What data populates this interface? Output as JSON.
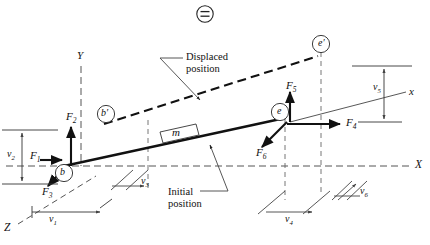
{
  "figure": {
    "type": "engineering-mechanics-free-body-diagram",
    "top_icon": "circled-equals-icon"
  },
  "axes": [
    {
      "name": "Y",
      "label": "Y",
      "style": "dashed",
      "direction": "up",
      "x": 81,
      "y": 57
    },
    {
      "name": "X",
      "label": "X",
      "style": "dashed",
      "direction": "right",
      "x": 418,
      "y": 166
    },
    {
      "name": "Z",
      "label": "Z",
      "style": "dashed",
      "direction": "lower-left",
      "x": 6,
      "y": 229
    },
    {
      "name": "x",
      "label": "x",
      "style": "solid",
      "direction": "up-right-incline",
      "x": 411,
      "y": 93
    }
  ],
  "points": [
    {
      "label": "b",
      "circled": true,
      "x": 64,
      "y": 173
    },
    {
      "label": "b′",
      "circled": true,
      "x": 106,
      "y": 114
    },
    {
      "label": "e",
      "circled": true,
      "x": 280,
      "y": 112
    },
    {
      "label": "e′",
      "circled": true,
      "x": 321,
      "y": 44
    }
  ],
  "forces": [
    {
      "label": "F",
      "sub": "1",
      "x": 34,
      "y": 157,
      "direction": "right"
    },
    {
      "label": "F",
      "sub": "2",
      "x": 72,
      "y": 118,
      "direction": "up"
    },
    {
      "label": "F",
      "sub": "3",
      "x": 48,
      "y": 192,
      "direction": "down-left"
    },
    {
      "label": "F",
      "sub": "4",
      "x": 351,
      "y": 122,
      "direction": "right"
    },
    {
      "label": "F",
      "sub": "5",
      "x": 294,
      "y": 88,
      "direction": "up"
    },
    {
      "label": "F",
      "sub": "6",
      "x": 261,
      "y": 153,
      "direction": "down-left"
    }
  ],
  "dimensions": [
    {
      "label": "v",
      "sub": "1",
      "x": 52,
      "y": 221,
      "orientation": "horizontal"
    },
    {
      "label": "v",
      "sub": "2",
      "x": 8,
      "y": 146,
      "orientation": "vertical"
    },
    {
      "label": "v",
      "sub": "3",
      "x": 143,
      "y": 181,
      "orientation": "diagonal"
    },
    {
      "label": "v",
      "sub": "4",
      "x": 289,
      "y": 222,
      "orientation": "horizontal"
    },
    {
      "label": "v",
      "sub": "5",
      "x": 376,
      "y": 88,
      "orientation": "vertical"
    },
    {
      "label": "v",
      "sub": "6",
      "x": 363,
      "y": 192,
      "orientation": "diagonal"
    }
  ],
  "body": {
    "mass_label": "m",
    "mass_box": {
      "x": 166,
      "y": 128
    }
  },
  "annotations": [
    {
      "name": "displaced-position",
      "line1": "Displaced",
      "line2": "position",
      "x": 186,
      "y": 54
    },
    {
      "name": "initial-position",
      "line1": "Initial",
      "line2": "position",
      "x": 168,
      "y": 189
    }
  ],
  "colors": {
    "ink": "#111111",
    "dash": "#555555",
    "background": "#ffffff"
  }
}
